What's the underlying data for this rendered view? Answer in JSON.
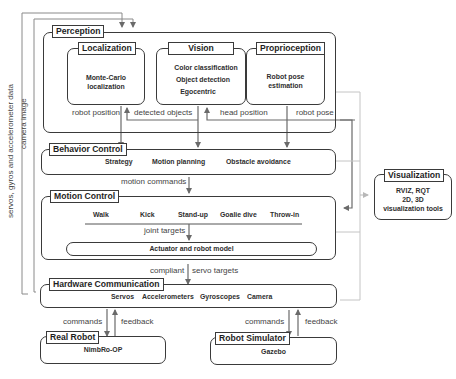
{
  "perception": {
    "title": "Perception",
    "localization": {
      "title": "Localization",
      "lines": [
        "Monte-Carlo",
        "localization"
      ]
    },
    "vision": {
      "title": "Vision",
      "lines": [
        "Color classification",
        "Object detection",
        "Egocentric"
      ]
    },
    "proprioception": {
      "title": "Proprioception",
      "lines": [
        "Robot pose",
        "estimation"
      ]
    }
  },
  "behavior_control": {
    "title": "Behavior Control",
    "items": [
      "Strategy",
      "Motion planning",
      "Obstacle avoidance"
    ]
  },
  "motion_control": {
    "title": "Motion Control",
    "motions": [
      "Walk",
      "Kick",
      "Stand-up",
      "Goalie dive",
      "Throw-in"
    ],
    "actuator": "Actuator and robot model"
  },
  "hardware_communication": {
    "title": "Hardware Communication",
    "items": [
      "Servos",
      "Accelerometers",
      "Gyroscopes",
      "Camera"
    ]
  },
  "real_robot": {
    "title": "Real Robot",
    "name": "NimbRo-OP"
  },
  "robot_simulator": {
    "title": "Robot Simulator",
    "name": "Gazebo"
  },
  "visualization": {
    "title": "Visualization",
    "lines": [
      "RVIZ, RQT",
      "2D, 3D",
      "visualization tools"
    ]
  },
  "edges": {
    "robot_position": "robot position",
    "detected_objects": "detected objects",
    "head_position": "head position",
    "robot_pose": "robot pose",
    "motion_commands": "motion commands",
    "joint_targets": "joint targets",
    "compliant": "compliant",
    "servo_targets": "servo targets",
    "commands_real": "commands",
    "feedback_real": "feedback",
    "commands_sim": "commands",
    "feedback_sim": "feedback",
    "sensor_data": "servos, gyros and accelerometer data",
    "camera_image": "camera image"
  }
}
